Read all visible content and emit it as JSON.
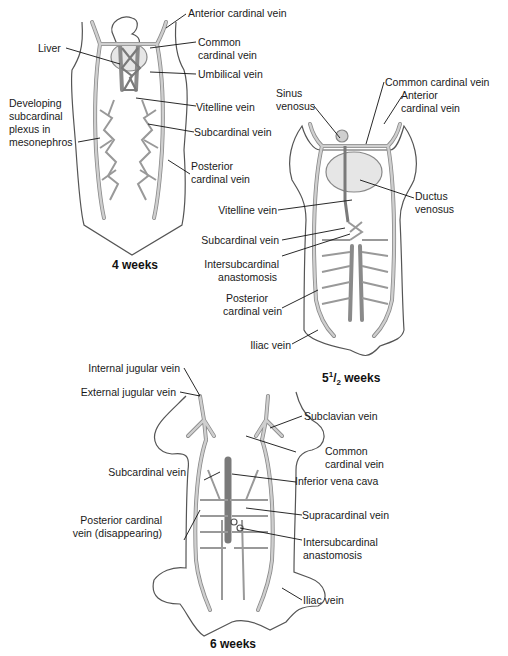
{
  "figure": {
    "colors": {
      "outline": "#555555",
      "vein_fill": "#cfcfcf",
      "vein_edge": "#8a8a8a",
      "ivc_fill": "#7a7a7a",
      "liver_fill": "#e6e6e6",
      "leader": "#111111"
    },
    "panels": [
      {
        "caption": "4 weeks",
        "labels": {
          "anterior_cardinal": "Anterior cardinal vein",
          "liver": "Liver",
          "common_cardinal_1": "Common",
          "common_cardinal_2": "cardinal vein",
          "umbilical": "Umbilical vein",
          "developing_1": "Developing",
          "developing_2": "subcardinal",
          "developing_3": "plexus in",
          "developing_4": "mesonephros",
          "vitelline": "Vitelline vein",
          "subcardinal": "Subcardinal vein",
          "posterior_1": "Posterior",
          "posterior_2": "cardinal vein"
        }
      },
      {
        "caption_main": "5",
        "caption_sup": "1",
        "caption_slash": "/",
        "caption_sub": "2",
        "caption_rest": " weeks",
        "labels": {
          "sinus_1": "Sinus",
          "sinus_2": "venosus",
          "common_cardinal": "Common cardinal vein",
          "anterior_1": "Anterior",
          "anterior_2": "cardinal vein",
          "ductus_1": "Ductus",
          "ductus_2": "venosus",
          "vitelline": "Vitelline vein",
          "subcardinal": "Subcardinal vein",
          "intersub_1": "Intersubcardinal",
          "intersub_2": "anastomosis",
          "posterior_1": "Posterior",
          "posterior_2": "cardinal vein",
          "iliac": "Iliac vein"
        }
      },
      {
        "caption": "6 weeks",
        "labels": {
          "internal_jugular": "Internal jugular vein",
          "external_jugular": "External jugular vein",
          "subclavian": "Subclavian vein",
          "common_cardinal_1": "Common",
          "common_cardinal_2": "cardinal vein",
          "subcardinal": "Subcardinal vein",
          "ivc": "Inferior vena cava",
          "posterior_1": "Posterior cardinal",
          "posterior_2": "vein (disappearing)",
          "supracardinal": "Supracardinal vein",
          "intersub_1": "Intersubcardinal",
          "intersub_2": "anastomosis",
          "iliac": "Iliac vein"
        }
      }
    ]
  }
}
